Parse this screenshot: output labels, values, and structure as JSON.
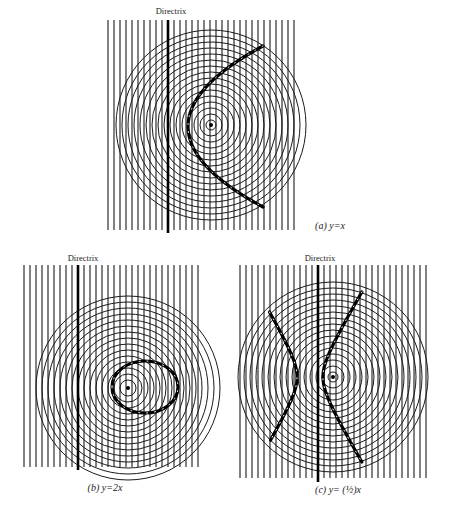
{
  "figure": {
    "width": 453,
    "height": 518,
    "panels": [
      {
        "id": "a",
        "caption": "(a) y=x",
        "caption_pos": {
          "x": 330,
          "y": 229
        },
        "directrix_label": "Directrix",
        "directrix_label_pos": {
          "x": 171,
          "y": 14
        },
        "lines": {
          "x_start": 108,
          "x_end": 294,
          "spacing": 6,
          "top": 20,
          "bottom": 230
        },
        "directrix": {
          "x": 168,
          "top": 20,
          "bottom": 233
        },
        "focus": {
          "x": 211,
          "y": 125
        },
        "rings": {
          "r_min": 5,
          "r_max": 95,
          "step": 6
        },
        "curve": {
          "type": "parabola",
          "vertex_x": 188,
          "center_y": 126.5,
          "end_x": 263,
          "half_span": 80.5
        }
      },
      {
        "id": "b",
        "caption": "(b) y=2x",
        "caption_pos": {
          "x": 105,
          "y": 491
        },
        "directrix_label": "Directrix",
        "directrix_label_pos": {
          "x": 83,
          "y": 261
        },
        "lines": {
          "x_start": 24,
          "x_end": 198,
          "spacing": 6,
          "top": 265,
          "bottom": 467
        },
        "directrix": {
          "x": 78,
          "top": 265,
          "bottom": 470
        },
        "focus": {
          "x": 128,
          "y": 388
        },
        "rings": {
          "r_min": 8,
          "r_max": 92,
          "step": 6
        },
        "curve": {
          "type": "ellipse",
          "cx": 145,
          "cy": 387,
          "rx": 33,
          "ry": 26
        }
      },
      {
        "id": "c",
        "caption": "(c) y= (½)x",
        "caption_pos": {
          "x": 338,
          "y": 493
        },
        "directrix_label": "Directrix",
        "directrix_label_pos": {
          "x": 320,
          "y": 261
        },
        "lines": {
          "x_start": 240,
          "x_end": 426,
          "spacing": 6,
          "top": 265,
          "bottom": 478
        },
        "directrix": {
          "x": 318,
          "top": 265,
          "bottom": 482
        },
        "focus": {
          "x": 333,
          "y": 377
        },
        "rings": {
          "r_min": 5,
          "r_max": 95,
          "step": 6
        },
        "curve": {
          "type": "hyperbola",
          "cx": 310,
          "cy": 377,
          "a": 13,
          "b": 22,
          "branches": [
            {
              "side": 1,
              "y_top": 292,
              "y_bottom": 462
            },
            {
              "side": -1,
              "y_top": 312,
              "y_bottom": 441
            }
          ]
        }
      }
    ]
  }
}
